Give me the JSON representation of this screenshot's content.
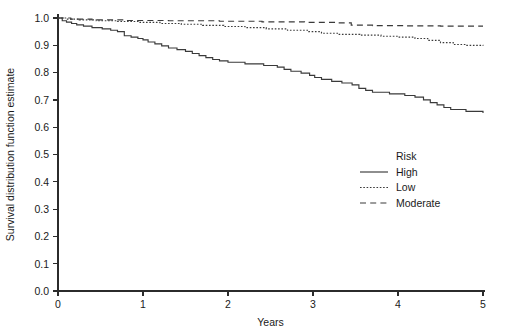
{
  "chart_data": {
    "type": "line",
    "title": "",
    "xlabel": "Years",
    "ylabel": "Survival distribution function estimate",
    "xlim": [
      0,
      5
    ],
    "ylim": [
      0,
      1
    ],
    "grid": false,
    "legend_position": "center-right",
    "legend_title": "Risk",
    "xticks": [
      "0",
      "1",
      "2",
      "3",
      "4",
      "5"
    ],
    "xtick_values": [
      0,
      1,
      2,
      3,
      4,
      5
    ],
    "yticks": [
      "0.0",
      "0.1",
      "0.2",
      "0.3",
      "0.4",
      "0.5",
      "0.6",
      "0.7",
      "0.8",
      "0.9",
      "1.0"
    ],
    "ytick_values": [
      0.0,
      0.1,
      0.2,
      0.3,
      0.4,
      0.5,
      0.6,
      0.7,
      0.8,
      0.9,
      1.0
    ],
    "series": [
      {
        "name": "High",
        "style": "solid",
        "color": "#3a3a3a",
        "points": [
          [
            0.0,
            1.0
          ],
          [
            0.05,
            0.99
          ],
          [
            0.1,
            0.985
          ],
          [
            0.16,
            0.98
          ],
          [
            0.22,
            0.975
          ],
          [
            0.3,
            0.97
          ],
          [
            0.4,
            0.965
          ],
          [
            0.52,
            0.96
          ],
          [
            0.62,
            0.955
          ],
          [
            0.7,
            0.95
          ],
          [
            0.78,
            0.935
          ],
          [
            0.86,
            0.93
          ],
          [
            0.94,
            0.925
          ],
          [
            1.0,
            0.92
          ],
          [
            1.06,
            0.912
          ],
          [
            1.14,
            0.905
          ],
          [
            1.22,
            0.898
          ],
          [
            1.3,
            0.89
          ],
          [
            1.4,
            0.884
          ],
          [
            1.5,
            0.878
          ],
          [
            1.58,
            0.87
          ],
          [
            1.66,
            0.862
          ],
          [
            1.74,
            0.855
          ],
          [
            1.82,
            0.848
          ],
          [
            1.9,
            0.843
          ],
          [
            2.0,
            0.838
          ],
          [
            2.2,
            0.832
          ],
          [
            2.42,
            0.826
          ],
          [
            2.58,
            0.82
          ],
          [
            2.66,
            0.812
          ],
          [
            2.74,
            0.805
          ],
          [
            2.86,
            0.798
          ],
          [
            2.96,
            0.79
          ],
          [
            3.02,
            0.782
          ],
          [
            3.1,
            0.775
          ],
          [
            3.22,
            0.768
          ],
          [
            3.34,
            0.762
          ],
          [
            3.46,
            0.755
          ],
          [
            3.54,
            0.742
          ],
          [
            3.62,
            0.735
          ],
          [
            3.7,
            0.728
          ],
          [
            3.9,
            0.722
          ],
          [
            4.08,
            0.716
          ],
          [
            4.2,
            0.71
          ],
          [
            4.3,
            0.7
          ],
          [
            4.38,
            0.69
          ],
          [
            4.46,
            0.682
          ],
          [
            4.54,
            0.672
          ],
          [
            4.62,
            0.665
          ],
          [
            4.8,
            0.658
          ],
          [
            5.0,
            0.652
          ]
        ]
      },
      {
        "name": "Low",
        "style": "dotted",
        "color": "#3a3a3a",
        "points": [
          [
            0.0,
            1.0
          ],
          [
            0.1,
            0.996
          ],
          [
            0.25,
            0.993
          ],
          [
            0.45,
            0.99
          ],
          [
            0.7,
            0.987
          ],
          [
            0.95,
            0.984
          ],
          [
            1.2,
            0.98
          ],
          [
            1.45,
            0.977
          ],
          [
            1.7,
            0.973
          ],
          [
            1.95,
            0.969
          ],
          [
            2.2,
            0.965
          ],
          [
            2.45,
            0.96
          ],
          [
            2.7,
            0.955
          ],
          [
            2.95,
            0.95
          ],
          [
            3.1,
            0.944
          ],
          [
            3.3,
            0.94
          ],
          [
            3.55,
            0.937
          ],
          [
            3.8,
            0.933
          ],
          [
            4.0,
            0.93
          ],
          [
            4.2,
            0.925
          ],
          [
            4.35,
            0.918
          ],
          [
            4.5,
            0.91
          ],
          [
            4.65,
            0.903
          ],
          [
            4.8,
            0.9
          ],
          [
            5.0,
            0.898
          ]
        ]
      },
      {
        "name": "Moderate",
        "style": "dashed",
        "color": "#3a3a3a",
        "points": [
          [
            0.0,
            1.0
          ],
          [
            0.15,
            0.996
          ],
          [
            0.4,
            0.993
          ],
          [
            0.8,
            0.991
          ],
          [
            1.3,
            0.99
          ],
          [
            1.9,
            0.988
          ],
          [
            2.4,
            0.986
          ],
          [
            2.9,
            0.984
          ],
          [
            3.3,
            0.982
          ],
          [
            3.45,
            0.974
          ],
          [
            3.7,
            0.972
          ],
          [
            4.1,
            0.971
          ],
          [
            4.5,
            0.97
          ],
          [
            5.0,
            0.97
          ]
        ]
      }
    ],
    "legend_entries": [
      {
        "label": "High",
        "style": "solid"
      },
      {
        "label": "Low",
        "style": "dotted"
      },
      {
        "label": "Moderate",
        "style": "dashed"
      }
    ]
  }
}
